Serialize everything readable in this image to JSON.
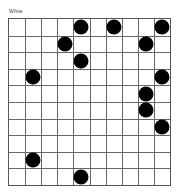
{
  "header": {
    "label": "White"
  },
  "board": {
    "columns": 10,
    "rows": 10,
    "stone_color": "#000000",
    "stones": [
      {
        "col": 4,
        "row": 0
      },
      {
        "col": 6,
        "row": 0
      },
      {
        "col": 9,
        "row": 0
      },
      {
        "col": 3,
        "row": 1
      },
      {
        "col": 8,
        "row": 1
      },
      {
        "col": 4,
        "row": 2
      },
      {
        "col": 1,
        "row": 3
      },
      {
        "col": 9,
        "row": 3
      },
      {
        "col": 8,
        "row": 4
      },
      {
        "col": 8,
        "row": 5
      },
      {
        "col": 9,
        "row": 6
      },
      {
        "col": 1,
        "row": 8
      },
      {
        "col": 4,
        "row": 9
      }
    ]
  }
}
